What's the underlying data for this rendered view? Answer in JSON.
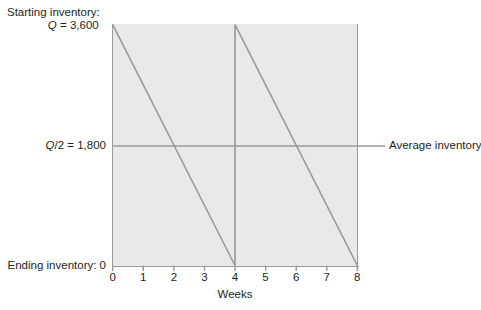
{
  "figure": {
    "background_color": "#ffffff",
    "plot_background_color": "#e9e9e9",
    "axis_color": "#9a9a9a",
    "series_color": "#999999",
    "text_color": "#231f20"
  },
  "labels": {
    "starting_inventory_line1": "Starting inventory:",
    "starting_inventory_line2_var": "Q",
    "starting_inventory_line2_rest": " = 3,600",
    "average_inventory_value": "Q/2 = 1,800",
    "ending_inventory": "Ending inventory: 0",
    "average_inventory_callout": "Average inventory",
    "x_axis_title": "Weeks"
  },
  "chart_data": {
    "type": "line",
    "title": "",
    "xlabel": "Weeks",
    "ylabel": "",
    "xlim": [
      0,
      8
    ],
    "ylim": [
      0,
      3600
    ],
    "xticks": [
      0,
      1,
      2,
      3,
      4,
      5,
      6,
      7,
      8
    ],
    "xtick_labels": [
      "0",
      "1",
      "2",
      "3",
      "4",
      "5",
      "6",
      "7",
      "8"
    ],
    "yticks": [
      0,
      1800,
      3600
    ],
    "ytick_labels": [
      "Ending inventory: 0",
      "Q/2 = 1,800",
      "Q = 3,600"
    ],
    "grid": false,
    "legend": "none",
    "series": [
      {
        "name": "Inventory level (sawtooth)",
        "color": "#999999",
        "x": [
          0,
          4,
          4,
          8
        ],
        "values": [
          3600,
          0,
          3600,
          0
        ]
      },
      {
        "name": "Average inventory",
        "color": "#999999",
        "x": [
          0,
          8
        ],
        "values": [
          1800,
          1800
        ]
      }
    ],
    "annotations": [
      {
        "text": "Starting inventory: Q = 3,600",
        "x": 0,
        "y": 3600,
        "position": "left-outside-top"
      },
      {
        "text": "Q/2 = 1,800",
        "x": 0,
        "y": 1800,
        "position": "left-outside"
      },
      {
        "text": "Ending inventory: 0",
        "x": 0,
        "y": 0,
        "position": "left-outside-bottom"
      },
      {
        "text": "Average inventory",
        "x": 8,
        "y": 1800,
        "position": "right-outside"
      }
    ]
  }
}
